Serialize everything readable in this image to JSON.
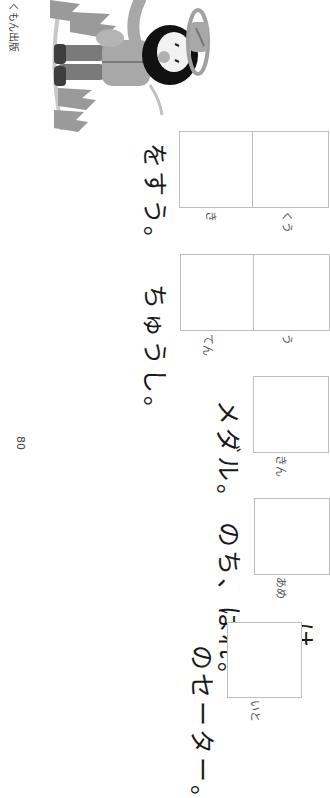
{
  "page": {
    "publisher": "くもん出版",
    "page_number": "80",
    "orientation": "rotated 90° clockwise"
  },
  "exercises": [
    {
      "id": 1,
      "prefix": "け",
      "kanji_answer_boxes": 1,
      "furigana": "いと",
      "sentence_after": "のセーター。"
    },
    {
      "id": 2,
      "prefix": "",
      "kanji_answer_boxes": 1,
      "furigana": "あめ",
      "sentence_after": "のち、はれ。"
    },
    {
      "id": 3,
      "prefix": "",
      "kanji_answer_boxes": 1,
      "furigana": "きん",
      "sentence_after": "メダル。"
    },
    {
      "id": 4,
      "prefix": "",
      "kanji_answer_boxes": 2,
      "furigana": [
        "う",
        "てん"
      ],
      "sentence_after": "ちゅうし。"
    },
    {
      "id": 5,
      "prefix": "",
      "kanji_answer_boxes": 2,
      "furigana": [
        "くう",
        "き"
      ],
      "sentence_after": "をすう。"
    }
  ],
  "illustration": {
    "icon": "hiker-illustration",
    "description": "grayscale hiker with hat among trees"
  },
  "colors": {
    "box_border": "#bdbdbd",
    "text": "#1a1a1a"
  }
}
